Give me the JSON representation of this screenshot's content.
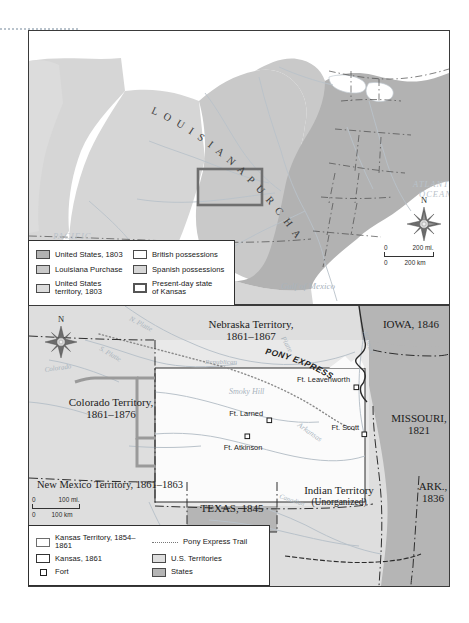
{
  "figure": {
    "type": "historical-map-plate",
    "maps": [
      "louisiana-purchase-1803",
      "kansas-territory-1854-1861"
    ]
  },
  "top_map": {
    "title_curved": "L O U I S I A N A   P U R C H A S E",
    "ocean_labels": {
      "pacific": "PACIFIC\nOCEAN",
      "pacific_line1": "PACIFIC",
      "pacific_line2": "OCEAN",
      "atlantic_line1": "ATLANTIC",
      "atlantic_line2": "OCEAN",
      "gulf": "Gulf of Mexico"
    },
    "river_labels": [
      "Missouri",
      "Mississippi",
      "Rio Grande"
    ],
    "compass": {
      "north_label": "N"
    },
    "scale": {
      "miles_zero": "0",
      "miles_value": "200 mi.",
      "km_zero": "0",
      "km_value": "200 km"
    },
    "legend": {
      "items": [
        {
          "swatch": "us1803",
          "label": "United States, 1803"
        },
        {
          "swatch": "british",
          "label": "British possessions"
        },
        {
          "swatch": "lapurchase",
          "label": "Louisiana Purchase"
        },
        {
          "swatch": "spanish",
          "label": "Spanish possessions"
        },
        {
          "swatch": "usterr",
          "label": "United States\nterritory, 1803"
        },
        {
          "swatch": "kansas-now",
          "label": "Present-day state\nof Kansas"
        }
      ]
    },
    "colors": {
      "united_states_1803": "#b2b2b2",
      "louisiana_purchase": "#c9c9c9",
      "united_states_territory_1803": "#dcdcdc",
      "british_possessions": "#ffffff",
      "spanish_possessions": "#d6d6d6",
      "kansas_outline": "#6f6f6f",
      "water": "#b9c2ca"
    }
  },
  "bottom_map": {
    "territory_labels": [
      {
        "name": "Nebraska Territory,",
        "dates": "1861–1867"
      },
      {
        "name": "Colorado Territory,",
        "dates": "1861–1876"
      },
      {
        "name": "New Mexico Territory, 1861–1863",
        "dates": ""
      },
      {
        "name": "Indian Territory",
        "dates": "(Unorganized)"
      }
    ],
    "state_labels": [
      "IOWA, 1846",
      "MISSOURI,",
      "1821",
      "ARK.,",
      "1836",
      "TEXAS, 1845"
    ],
    "forts": [
      {
        "name": "Ft. Leavenworth"
      },
      {
        "name": "Ft. Larned"
      },
      {
        "name": "Ft. Atkinson"
      },
      {
        "name": "Ft. Scott"
      }
    ],
    "trail_label": "PONY EXPRESS",
    "river_labels": [
      "N. Platte",
      "S. Platte",
      "Platte",
      "Republican",
      "Smoky Hill",
      "Arkansas",
      "Colorado",
      "Missouri",
      "Canadian"
    ],
    "compass": {
      "north_label": "N"
    },
    "scale": {
      "miles_zero": "0",
      "miles_value": "100 mi.",
      "km_zero": "0",
      "km_value": "100 km"
    },
    "legend": {
      "items": [
        {
          "swatch": "ks-terr",
          "label": "Kansas Territory, 1854–1861"
        },
        {
          "swatch": "pony",
          "label": "Pony Express Trail"
        },
        {
          "swatch": "ks-1861",
          "label": "Kansas, 1861"
        },
        {
          "swatch": "usterr2",
          "label": "U.S. Territories"
        },
        {
          "swatch": "fort",
          "label": "Fort"
        },
        {
          "swatch": "states",
          "label": "States"
        }
      ]
    },
    "colors": {
      "us_territories": "#dedede",
      "states": "#b5b5b5",
      "kansas_1861": "#fafafa",
      "kansas_territory_border": "#6d6d6d",
      "water": "#b9c2ca"
    }
  }
}
